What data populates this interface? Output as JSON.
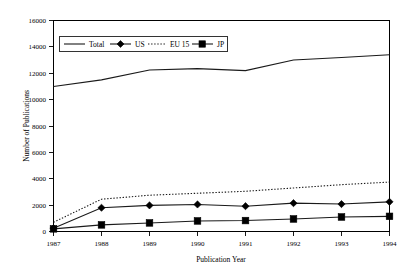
{
  "chart_data": {
    "type": "line",
    "title": "",
    "xlabel": "Publication Year",
    "ylabel": "Number of Publications",
    "categories": [
      "1987",
      "1988",
      "1989",
      "1990",
      "1991",
      "1992",
      "1993",
      "1994"
    ],
    "x": [
      1987,
      1988,
      1989,
      1990,
      1991,
      1992,
      1993,
      1994
    ],
    "ylim": [
      0,
      16000
    ],
    "yticks": [
      0,
      2000,
      4000,
      6000,
      8000,
      10000,
      12000,
      14000,
      16000
    ],
    "ytick_labels": [
      "0",
      "2000",
      "4000",
      "6000",
      "8000",
      "10000",
      "12000",
      "14000",
      "16000"
    ],
    "xtick_labels": [
      "1987",
      "1988",
      "1989",
      "1990",
      "1991",
      "1992",
      "1993",
      "1994"
    ],
    "grid": false,
    "legend_position": "upper-left-inside",
    "series": [
      {
        "name": "Total",
        "style": "solid",
        "marker": "none",
        "values": [
          11000,
          11500,
          12250,
          12350,
          12200,
          13000,
          13200,
          13400
        ]
      },
      {
        "name": "US",
        "style": "solid",
        "marker": "diamond",
        "values": [
          250,
          1800,
          1980,
          2050,
          1920,
          2150,
          2080,
          2250
        ]
      },
      {
        "name": "EU 15",
        "style": "dotted",
        "marker": "none",
        "values": [
          700,
          2450,
          2750,
          2900,
          3050,
          3300,
          3550,
          3750
        ]
      },
      {
        "name": "JP",
        "style": "solid",
        "marker": "square",
        "values": [
          200,
          500,
          650,
          800,
          830,
          950,
          1100,
          1150
        ]
      }
    ]
  },
  "legend": {
    "items": [
      {
        "label": "Total",
        "style": "solid",
        "marker": "none"
      },
      {
        "label": "US",
        "style": "solid",
        "marker": "diamond"
      },
      {
        "label": "EU 15",
        "style": "dotted",
        "marker": "none"
      },
      {
        "label": "JP",
        "style": "solid",
        "marker": "square"
      }
    ]
  },
  "colors": {
    "line": "#1a1a1a",
    "axis": "#000000",
    "background": "#ffffff",
    "marker": "#000000"
  }
}
